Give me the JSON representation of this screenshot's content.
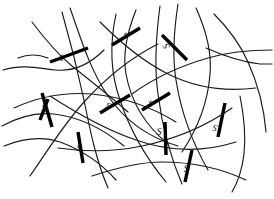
{
  "figure": {
    "background_color": "#ffffff",
    "chain_color": "#1a1a1a",
    "crosslink_color": "#000000",
    "label_color": "#111111",
    "width": 274,
    "height": 199
  },
  "chart_data": {
    "type": "diagram",
    "xlabel": "",
    "ylabel": "",
    "crosslink_count": 11,
    "chain_count": 22,
    "crosslink_label_text": "S",
    "crosslinks": [
      {
        "id": 1,
        "label": "S",
        "x1": 50,
        "y1": 62,
        "x2": 88,
        "y2": 48,
        "label_x": 63,
        "label_y": 55,
        "label_rotation": -160
      },
      {
        "id": 2,
        "label": "S",
        "x1": 112,
        "y1": 45,
        "x2": 140,
        "y2": 28,
        "label_x": 127,
        "label_y": 33,
        "label_rotation": -155
      },
      {
        "id": 3,
        "label": "S",
        "x1": 187,
        "y1": 60,
        "x2": 162,
        "y2": 35,
        "label_x": 169,
        "label_y": 45,
        "label_rotation": -118
      },
      {
        "id": 4,
        "label": "S",
        "x1": 42,
        "y1": 93,
        "x2": 52,
        "y2": 127,
        "label_x": 44,
        "label_y": 111,
        "label_rotation": 0
      },
      {
        "id": 5,
        "label": "S",
        "x1": 100,
        "y1": 113,
        "x2": 130,
        "y2": 95,
        "label_x": 110,
        "label_y": 103,
        "label_rotation": -150
      },
      {
        "id": 6,
        "label": "S",
        "x1": 142,
        "y1": 110,
        "x2": 170,
        "y2": 93,
        "label_x": 152,
        "label_y": 101,
        "label_rotation": -155
      },
      {
        "id": 7,
        "label": "S",
        "x1": 165,
        "y1": 122,
        "x2": 166,
        "y2": 155,
        "label_x": 159,
        "label_y": 135,
        "label_rotation": 0
      },
      {
        "id": 8,
        "label": "S",
        "x1": 78,
        "y1": 132,
        "x2": 83,
        "y2": 163,
        "label_x": 80,
        "label_y": 145,
        "label_rotation": -160
      },
      {
        "id": 9,
        "label": "S",
        "x1": 225,
        "y1": 103,
        "x2": 218,
        "y2": 137,
        "label_x": 216,
        "label_y": 125,
        "label_rotation": -165
      },
      {
        "id": 10,
        "label": "S",
        "x1": 192,
        "y1": 150,
        "x2": 185,
        "y2": 182,
        "label_x": 186,
        "label_y": 172,
        "label_rotation": 0
      },
      {
        "id": 11,
        "label": "S",
        "x1": 48,
        "y1": 99,
        "x2": 40,
        "y2": 120,
        "label_x": 44,
        "label_y": 112,
        "label_rotation": 0
      }
    ],
    "chains": [
      {
        "id": 1,
        "path": "M 3 70 C 22 64 38 68 55 70 C 75 72 90 64 104 50"
      },
      {
        "id": 2,
        "path": "M 32 22 C 44 38 55 52 72 66 C 92 82 110 96 128 112"
      },
      {
        "id": 3,
        "path": "M 62 12 C 70 40 78 72 84 100 C 90 130 96 160 108 188"
      },
      {
        "id": 4,
        "path": "M 70 8 C 80 36 90 70 108 96 C 126 122 150 138 178 146"
      },
      {
        "id": 5,
        "path": "M 14 108 C 40 96 66 92 92 94 C 122 97 150 106 176 122"
      },
      {
        "id": 6,
        "path": "M 116 14 C 110 42 110 72 120 100 C 130 130 146 158 166 182"
      },
      {
        "id": 7,
        "path": "M 2 126 C 20 116 36 112 54 114 C 80 117 102 128 124 146"
      },
      {
        "id": 8,
        "path": "M 136 10 C 128 30 122 52 126 74 C 131 102 146 126 168 144"
      },
      {
        "id": 9,
        "path": "M 30 176 C 48 150 64 124 84 102 C 106 78 130 58 158 44"
      },
      {
        "id": 10,
        "path": "M 160 6 C 156 36 154 66 158 94 C 162 126 170 156 182 184"
      },
      {
        "id": 11,
        "path": "M 100 22 C 122 44 144 62 168 74 C 196 88 224 92 256 88"
      },
      {
        "id": 12,
        "path": "M 4 146 C 24 138 42 136 60 142 C 82 150 100 162 116 180"
      },
      {
        "id": 13,
        "path": "M 178 4 C 174 30 172 56 176 80 C 181 112 192 142 208 170"
      },
      {
        "id": 14,
        "path": "M 50 96 C 78 114 106 130 136 140 C 170 152 204 152 236 142"
      },
      {
        "id": 15,
        "path": "M 196 8 C 206 30 212 52 210 74 C 208 102 198 128 182 152"
      },
      {
        "id": 16,
        "path": "M 58 148 C 86 152 114 152 142 146 C 176 139 206 126 232 108"
      },
      {
        "id": 17,
        "path": "M 214 14 C 228 28 240 44 248 62 C 258 84 264 108 266 132"
      },
      {
        "id": 18,
        "path": "M 92 176 C 116 168 138 162 162 162 C 192 162 220 168 246 180"
      },
      {
        "id": 19,
        "path": "M 272 50 C 250 50 228 52 208 58 C 180 66 154 78 132 94"
      },
      {
        "id": 20,
        "path": "M 240 96 C 244 116 246 136 244 154 C 242 170 238 182 232 192"
      },
      {
        "id": 21,
        "path": "M 206 48 C 224 56 242 62 260 64 C 266 64 270 64 272 64"
      },
      {
        "id": 22,
        "path": "M 18 58 C 28 54 38 54 48 58"
      }
    ]
  }
}
